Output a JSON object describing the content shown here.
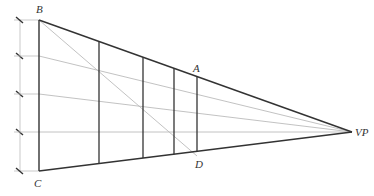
{
  "diagram": {
    "labels": {
      "B": "B",
      "C": "C",
      "A": "A",
      "D": "D",
      "VP": "VP"
    },
    "colors": {
      "main_line": "#333333",
      "construction_line": "#bbbbbb",
      "background": "#ffffff"
    },
    "points": {
      "B": [
        39,
        20
      ],
      "C": [
        39,
        171
      ],
      "VP": [
        352,
        132
      ],
      "A": [
        197,
        72
      ],
      "D": [
        197,
        156
      ]
    },
    "dimension_ticks_y": [
      20,
      56,
      94,
      132,
      171
    ],
    "vertical_lines_x": [
      99,
      143,
      174,
      197
    ]
  }
}
